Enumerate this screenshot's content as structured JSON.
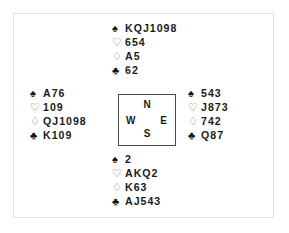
{
  "diagram": {
    "type": "bridge-deal-diagram",
    "suit_symbols": {
      "spades": "♠",
      "hearts": "♡",
      "diamonds": "♢",
      "clubs": "♣"
    },
    "compass": {
      "north": "N",
      "west": "W",
      "east": "E",
      "south": "S"
    },
    "hands": {
      "north": {
        "spades": "KQJ1098",
        "hearts": "654",
        "diamonds": "A5",
        "clubs": "62"
      },
      "west": {
        "spades": "A76",
        "hearts": "109",
        "diamonds": "QJ1098",
        "clubs": "K109"
      },
      "east": {
        "spades": "543",
        "hearts": "J873",
        "diamonds": "742",
        "clubs": "Q87"
      },
      "south": {
        "spades": "2",
        "hearts": "AKQ2",
        "diamonds": "K63",
        "clubs": "AJ543"
      }
    },
    "colors": {
      "black_suit": "#111111",
      "red_suit_outline": "#6e6e6e",
      "text": "#1a1a1a",
      "box_border": "#4a4a4a",
      "frame_border": "#e2e2e2",
      "background": "#ffffff"
    }
  }
}
